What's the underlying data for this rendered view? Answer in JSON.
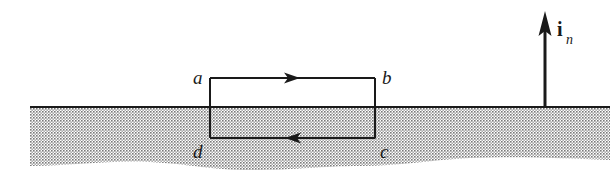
{
  "diagram": {
    "type": "contour-across-interface",
    "labels": {
      "a": "a",
      "b": "b",
      "c": "c",
      "d": "d",
      "normal_vector": "i",
      "normal_subscript": "n"
    },
    "colors": {
      "line": "#1a1a1a",
      "medium_dots": "#8a8a8a",
      "background": "#ffffff"
    },
    "contour": {
      "top_edge_direction": "a-to-b (right)",
      "bottom_edge_direction": "c-to-d (left)"
    }
  }
}
